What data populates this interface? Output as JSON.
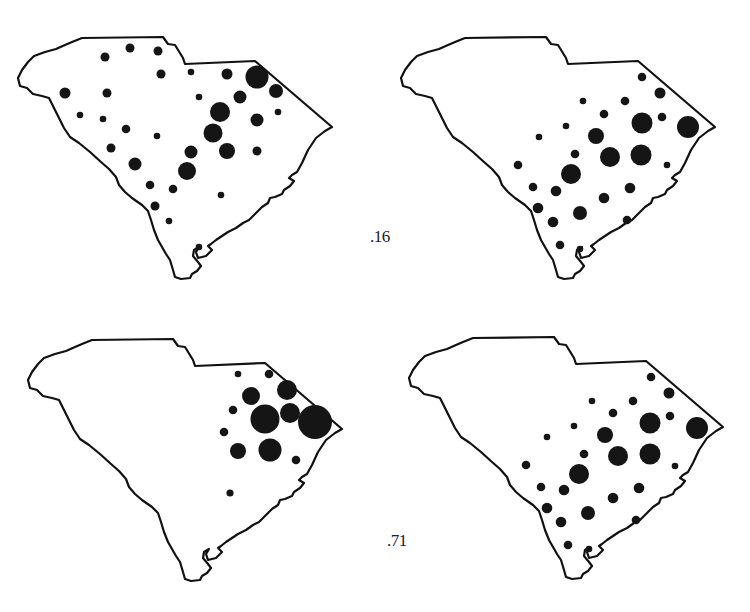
{
  "figure": {
    "type": "proportional-symbol-maps",
    "region": "South Carolina",
    "layout": "2x2 grid",
    "colors": {
      "outline": "#111111",
      "symbol": "#151515",
      "background": "#ffffff"
    }
  },
  "labels": [
    {
      "id": "label-top",
      "text": ".16",
      "x": 370,
      "y": 227
    },
    {
      "id": "label-bottom",
      "text": ".71",
      "x": 387,
      "y": 531
    }
  ],
  "maps": [
    {
      "id": "map-top-left",
      "offset": [
        0,
        0
      ],
      "dots": [
        [
          105,
          57,
          4.5
        ],
        [
          130,
          48,
          4.5
        ],
        [
          158,
          51,
          4.5
        ],
        [
          161,
          74,
          4.5
        ],
        [
          191,
          72,
          3.3
        ],
        [
          227,
          74,
          5.5
        ],
        [
          257,
          77,
          11.5
        ],
        [
          276,
          91,
          7
        ],
        [
          240,
          97,
          6.5
        ],
        [
          65,
          93,
          5.5
        ],
        [
          107,
          93,
          4.5
        ],
        [
          199,
          97,
          3.3
        ],
        [
          220,
          112,
          10
        ],
        [
          278,
          112,
          3.3
        ],
        [
          257,
          120,
          6.5
        ],
        [
          80,
          115,
          3.3
        ],
        [
          103,
          119,
          3.3
        ],
        [
          126,
          129,
          4.3
        ],
        [
          157,
          136,
          3.3
        ],
        [
          213,
          133,
          9.5
        ],
        [
          111,
          148,
          4.5
        ],
        [
          191,
          152,
          6.5
        ],
        [
          227,
          151,
          8
        ],
        [
          257,
          151,
          4.5
        ],
        [
          135,
          164,
          6.5
        ],
        [
          187,
          171,
          9
        ],
        [
          150,
          185,
          4.3
        ],
        [
          173,
          189,
          4.3
        ],
        [
          221,
          195,
          3.3
        ],
        [
          155,
          206,
          4.5
        ],
        [
          169,
          221,
          3.3
        ],
        [
          199,
          247,
          3.3
        ]
      ]
    },
    {
      "id": "map-top-right",
      "offset": [
        375,
        0
      ],
      "dots": [
        [
          267,
          77,
          4.3
        ],
        [
          285,
          93,
          5.5
        ],
        [
          208,
          101,
          3.3
        ],
        [
          250,
          101,
          4.3
        ],
        [
          229,
          114,
          4.3
        ],
        [
          267,
          123,
          10.5
        ],
        [
          287,
          117,
          4.3
        ],
        [
          313,
          127,
          11
        ],
        [
          191,
          126,
          3.3
        ],
        [
          164,
          137,
          3.3
        ],
        [
          221,
          136,
          8
        ],
        [
          235,
          157,
          10
        ],
        [
          266,
          155,
          10.5
        ],
        [
          200,
          154,
          4.3
        ],
        [
          143,
          165,
          4.3
        ],
        [
          196,
          174,
          10
        ],
        [
          292,
          165,
          3.3
        ],
        [
          158,
          187,
          4.3
        ],
        [
          181,
          191,
          5.3
        ],
        [
          255,
          188,
          5.3
        ],
        [
          229,
          198,
          5.3
        ],
        [
          163,
          208,
          5.3
        ],
        [
          205,
          213,
          7
        ],
        [
          178,
          222,
          5.3
        ],
        [
          252,
          220,
          4.3
        ],
        [
          185,
          245,
          4.3
        ],
        [
          205,
          249,
          3.3
        ]
      ]
    },
    {
      "id": "map-bottom-left",
      "offset": [
        0,
        306
      ],
      "dots": [
        [
          238,
          68,
          3.3
        ],
        [
          269,
          68,
          4.3
        ],
        [
          251,
          90,
          9
        ],
        [
          287,
          84,
          10
        ],
        [
          233,
          104,
          4.3
        ],
        [
          265,
          113,
          14.5
        ],
        [
          290,
          107,
          10
        ],
        [
          315,
          116,
          17
        ],
        [
          224,
          126,
          4.3
        ],
        [
          238,
          145,
          8
        ],
        [
          270,
          144,
          11.5
        ],
        [
          296,
          154,
          4.3
        ],
        [
          230,
          187,
          3.6
        ]
      ]
    },
    {
      "id": "map-bottom-right",
      "offset": [
        375,
        306
      ],
      "dots": [
        [
          276,
          71,
          4.3
        ],
        [
          294,
          87,
          5.5
        ],
        [
          217,
          95,
          3.3
        ],
        [
          258,
          95,
          4.3
        ],
        [
          238,
          107,
          4.3
        ],
        [
          275,
          117,
          10.5
        ],
        [
          295,
          110,
          4.3
        ],
        [
          322,
          122,
          11
        ],
        [
          199,
          120,
          3.3
        ],
        [
          172,
          131,
          3.3
        ],
        [
          230,
          129,
          8
        ],
        [
          243,
          150,
          10
        ],
        [
          275,
          148,
          10.5
        ],
        [
          209,
          148,
          4.3
        ],
        [
          151,
          159,
          4.3
        ],
        [
          204,
          168,
          10
        ],
        [
          300,
          160,
          3.3
        ],
        [
          166,
          181,
          4.3
        ],
        [
          189,
          184,
          5.3
        ],
        [
          264,
          182,
          5.3
        ],
        [
          238,
          192,
          5.3
        ],
        [
          172,
          202,
          5.3
        ],
        [
          213,
          207,
          7
        ],
        [
          186,
          216,
          5.3
        ],
        [
          261,
          214,
          4.3
        ],
        [
          193,
          239,
          4.3
        ],
        [
          214,
          243,
          3.3
        ]
      ]
    }
  ]
}
